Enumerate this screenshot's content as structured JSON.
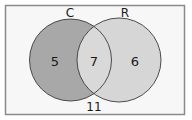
{
  "venn": {
    "sets": [
      {
        "label": "C",
        "only_count": "5",
        "fill": "#a8a8a8"
      },
      {
        "label": "R",
        "only_count": "6",
        "fill": "#d6d6d6"
      }
    ],
    "intersection_count": "7",
    "outside_count": "11",
    "colors": {
      "frame_border": "#8a8a8a",
      "background": "#f7f7f7",
      "circle_stroke": "#3a3a3a"
    }
  }
}
